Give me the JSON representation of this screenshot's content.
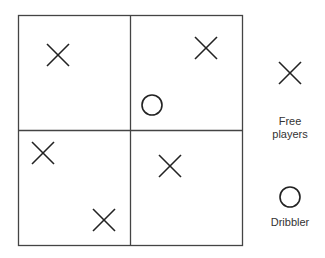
{
  "diagram": {
    "title": "",
    "grid": {
      "rows": 2,
      "cols": 2
    },
    "free_players": [
      {
        "quadrant": "top-left",
        "x": 58,
        "y": 55
      },
      {
        "quadrant": "top-right",
        "x": 206,
        "y": 48
      },
      {
        "quadrant": "bottom-left",
        "x": 43,
        "y": 153
      },
      {
        "quadrant": "bottom-left",
        "x": 104,
        "y": 220
      },
      {
        "quadrant": "bottom-right",
        "x": 170,
        "y": 166
      }
    ],
    "dribbler": {
      "quadrant": "top-right",
      "x": 152,
      "y": 105
    }
  },
  "legend": {
    "free_players_line1": "Free",
    "free_players_line2": "players",
    "dribbler_label": "Dribbler"
  },
  "colors": {
    "stroke": "#222222",
    "grid": "#444444"
  }
}
